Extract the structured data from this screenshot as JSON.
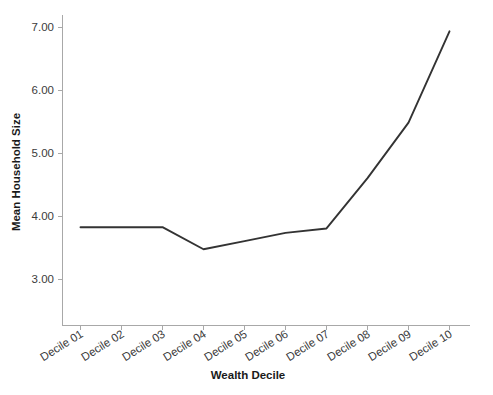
{
  "chart_data": {
    "type": "line",
    "title": "",
    "subtitle": "",
    "xlabel": "Wealth Decile",
    "ylabel": "Mean Household Size",
    "categories": [
      "Decile 01",
      "Decile 02",
      "Decile 03",
      "Decile 04",
      "Decile 05",
      "Decile 06",
      "Decile 07",
      "Decile 08",
      "Decile 09",
      "Decile 10"
    ],
    "values": [
      3.83,
      3.83,
      3.83,
      3.48,
      3.61,
      3.74,
      3.81,
      4.61,
      5.49,
      6.94
    ],
    "series": [
      {
        "name": "Mean Household Size",
        "color": "#333333",
        "values": [
          3.83,
          3.83,
          3.83,
          3.48,
          3.61,
          3.74,
          3.81,
          4.61,
          5.49,
          6.94
        ]
      }
    ],
    "ylim": [
      2.55,
      7.25
    ],
    "ytick_values": [
      3.0,
      4.0,
      5.0,
      6.0,
      7.0
    ],
    "ytick_labels": [
      "3.00",
      "4.00",
      "5.00",
      "6.00",
      "7.00"
    ],
    "xtick_rotation_degrees": -32,
    "grid": false,
    "legend": false,
    "legend_position": "none",
    "line_color": "#333333",
    "axis_color": "#a8a8a8",
    "background_color": "#ffffff",
    "text_color": "#3b3b3b",
    "title_color": "#1a1a1a"
  }
}
